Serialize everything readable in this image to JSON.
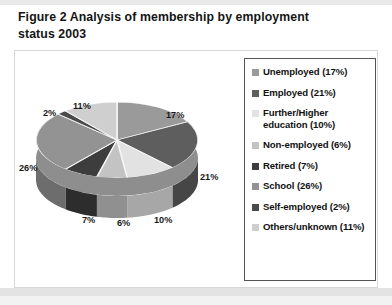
{
  "figure": {
    "title": "Figure 2  Analysis of membership by employment\nstatus 2003"
  },
  "chart_data": {
    "type": "pie",
    "title": "Figure 2  Analysis of membership by employment status 2003",
    "three_d": true,
    "legend_position": "right",
    "categories": [
      "Unemployed",
      "Employed",
      "Further/Higher education",
      "Non-employed",
      "Retired",
      "School",
      "Self-employed",
      "Others/unknown"
    ],
    "values": [
      17,
      21,
      10,
      6,
      7,
      26,
      2,
      11
    ],
    "value_unit": "%",
    "colors": [
      "#9a9a9a",
      "#5e5e5e",
      "#e2e2e2",
      "#c3c3c3",
      "#3d3d3d",
      "#939393",
      "#4a4a4a",
      "#cfcfcf"
    ],
    "data_labels": [
      "17%",
      "21%",
      "10%",
      "6%",
      "7%",
      "26%",
      "2%",
      "11%"
    ]
  },
  "legend": {
    "items": [
      {
        "label": "Unemployed (17%)",
        "color": "#9a9a9a"
      },
      {
        "label": "Employed (21%)",
        "color": "#5e5e5e"
      },
      {
        "label": "Further/Higher education (10%)",
        "color": "#e2e2e2"
      },
      {
        "label": "Non-employed (6%)",
        "color": "#c3c3c3"
      },
      {
        "label": "Retired (7%)",
        "color": "#3d3d3d"
      },
      {
        "label": "School (26%)",
        "color": "#939393"
      },
      {
        "label": "Self-employed (2%)",
        "color": "#4a4a4a"
      },
      {
        "label": "Others/unknown (11%)",
        "color": "#cfcfcf"
      }
    ]
  },
  "pie_labels": [
    {
      "text": "17%",
      "x": 152,
      "y": 60
    },
    {
      "text": "21%",
      "x": 186,
      "y": 122
    },
    {
      "text": "10%",
      "x": 140,
      "y": 165
    },
    {
      "text": "6%",
      "x": 103,
      "y": 168
    },
    {
      "text": "7%",
      "x": 68,
      "y": 165
    },
    {
      "text": "26%",
      "x": 5,
      "y": 113
    },
    {
      "text": "2%",
      "x": 29,
      "y": 58
    },
    {
      "text": "11%",
      "x": 59,
      "y": 51
    }
  ]
}
